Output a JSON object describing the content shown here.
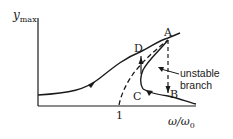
{
  "diagram": {
    "title": "",
    "y_axis_label": "y",
    "y_axis_subscript": "max",
    "x_axis_label": "ω/ω",
    "x_axis_subscript": "0",
    "x_tick": "1",
    "points": {
      "A": "A",
      "B": "B",
      "C": "C",
      "D": "D"
    },
    "annotation_line1": "unstable",
    "annotation_line2": "branch",
    "colors": {
      "stroke": "#1a1a1a",
      "background": "#ffffff"
    }
  }
}
